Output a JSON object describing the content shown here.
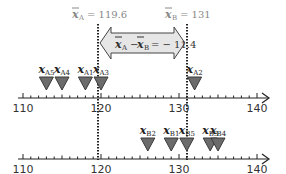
{
  "figure": {
    "mean_a_label": "x̄A = 119.6",
    "mean_a": {
      "symbol": "x",
      "subscript": "A",
      "eq": "= 119.6",
      "value": 119.6
    },
    "mean_b": {
      "symbol": "x",
      "subscript": "B",
      "eq": "= 131",
      "value": 131
    },
    "difference": {
      "left_sym": "x",
      "left_sub": "A",
      "minus": "−",
      "right_sym": "x",
      "right_sub": "B",
      "eq": "= − 11.4",
      "value": -11.4
    },
    "axis_ticks": [
      "110",
      "120",
      "130",
      "140"
    ],
    "axis_min": 110,
    "axis_max": 140,
    "group_a": [
      {
        "label": "x",
        "sub": "A5",
        "value": 113
      },
      {
        "label": "x",
        "sub": "A4",
        "value": 115
      },
      {
        "label": "x",
        "sub": "A1",
        "value": 118
      },
      {
        "label": "x",
        "sub": "A3",
        "value": 120
      },
      {
        "label": "x",
        "sub": "A2",
        "value": 132
      }
    ],
    "group_b": [
      {
        "label": "x",
        "sub": "B2",
        "value": 126
      },
      {
        "label": "x",
        "sub": "B1",
        "value": 129
      },
      {
        "label": "x",
        "sub": "B5",
        "value": 131
      },
      {
        "label": "x",
        "sub": "B3",
        "value": 134
      },
      {
        "label": "x",
        "sub": "B4",
        "value": 135
      }
    ],
    "colors": {
      "triangle_fill": "#6b6b6b",
      "triangle_stroke": "#3a3a3a",
      "arrow_fill": "#e6e6e6",
      "arrow_stroke": "#444444",
      "axis": "#222222",
      "mean_label": "#888888",
      "tick_label": "#333333"
    }
  }
}
